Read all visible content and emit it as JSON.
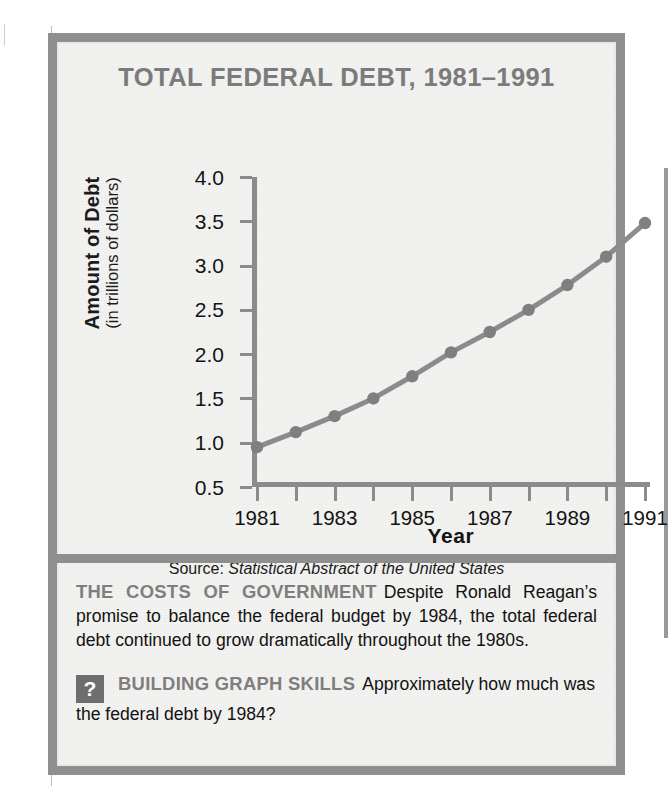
{
  "figure": {
    "title": "TOTAL FEDERAL DEBT, 1981–1991",
    "source_prefix": "Source:",
    "source_title": "Statistical Abstract of the United States"
  },
  "chart_data": {
    "type": "line",
    "title": "TOTAL FEDERAL DEBT, 1981–1991",
    "xlabel": "Year",
    "ylabel": "Amount of Debt (in trillions of dollars)",
    "ylabel_main": "Amount of Debt",
    "ylabel_sub": "(in trillions of dollars)",
    "grid": false,
    "legend": "none",
    "ylim": [
      0.5,
      4.0
    ],
    "ytick_values": [
      4.0,
      3.5,
      3.0,
      2.5,
      2.0,
      1.5,
      1.0,
      0.5
    ],
    "ytick_labels": [
      "4.0",
      "3.5",
      "3.0",
      "2.5",
      "2.0",
      "1.5",
      "1.0",
      "0.5"
    ],
    "x": [
      1981,
      1982,
      1983,
      1984,
      1985,
      1986,
      1987,
      1988,
      1989,
      1990,
      1991
    ],
    "xtick_values": [
      1981,
      1982,
      1983,
      1984,
      1985,
      1986,
      1987,
      1988,
      1989,
      1990,
      1991
    ],
    "xtick_labels": [
      "1981",
      "",
      "1983",
      "",
      "1985",
      "",
      "1987",
      "",
      "1989",
      "",
      "1991"
    ],
    "values": [
      0.95,
      1.12,
      1.3,
      1.5,
      1.75,
      2.02,
      2.25,
      2.5,
      2.78,
      3.1,
      3.48
    ],
    "series": [
      {
        "name": "Total federal debt",
        "values": [
          0.95,
          1.12,
          1.3,
          1.5,
          1.75,
          2.02,
          2.25,
          2.5,
          2.78,
          3.1,
          3.48
        ]
      }
    ],
    "colors": {
      "line": "#8c8c8c",
      "marker": "#808080",
      "axis": "#8c8c8c",
      "title": "#7c7c7c",
      "paper": "#f2f2f0",
      "border": "#8f8f8f"
    }
  },
  "caption": {
    "heading": "THE COSTS OF GOVERNMENT",
    "body": "Despite Ronald Reagan’s promise to balance the federal budget by 1984, the total federal debt continued to grow dramatically throughout the 1980s."
  },
  "skills": {
    "icon_glyph": "?",
    "icon_name": "question-mark-icon",
    "heading": "BUILDING GRAPH SKILLS",
    "question": "Approximately how much was the federal debt by 1984?"
  }
}
